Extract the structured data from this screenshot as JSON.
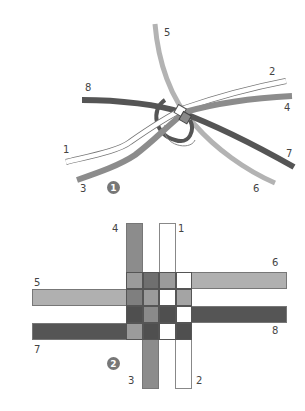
{
  "figure_1": {
    "badge": "1",
    "strand_labels": [
      {
        "id": "1",
        "x": 63,
        "y": 150
      },
      {
        "id": "2",
        "x": 269,
        "y": 70
      },
      {
        "id": "3",
        "x": 80,
        "y": 185
      },
      {
        "id": "4",
        "x": 284,
        "y": 105
      },
      {
        "id": "5",
        "x": 164,
        "y": 30
      },
      {
        "id": "6",
        "x": 253,
        "y": 185
      },
      {
        "id": "7",
        "x": 286,
        "y": 150
      },
      {
        "id": "8",
        "x": 85,
        "y": 85
      }
    ]
  },
  "figure_2": {
    "badge": "2",
    "strand_labels": [
      {
        "id": "4",
        "x": 112,
        "y": 226
      },
      {
        "id": "1",
        "x": 176,
        "y": 226
      },
      {
        "id": "6",
        "x": 270,
        "y": 258
      },
      {
        "id": "5",
        "x": 33,
        "y": 278
      },
      {
        "id": "8",
        "x": 270,
        "y": 325
      },
      {
        "id": "7",
        "x": 33,
        "y": 345
      },
      {
        "id": "3",
        "x": 128,
        "y": 375
      },
      {
        "id": "2",
        "x": 196,
        "y": 375
      }
    ],
    "grid_colors": [
      [
        "#9b9b9b",
        "#6f6f6f",
        "#9b9b9b",
        "#ffffff"
      ],
      [
        "#7f7f7f",
        "#9b9b9b",
        "#ffffff",
        "#a4a4a4"
      ],
      [
        "#4f4f4f",
        "#8a8a8a",
        "#4f4f4f",
        "#ffffff"
      ],
      [
        "#9b9b9b",
        "#4f4f4f",
        "#ffffff",
        "#4f4f4f"
      ]
    ]
  },
  "colors": {
    "white_strand": "#ffffff",
    "light_gray": "#b0b0b0",
    "medium_gray": "#8c8c8c",
    "dark_gray": "#555555",
    "badge": "#777777"
  }
}
